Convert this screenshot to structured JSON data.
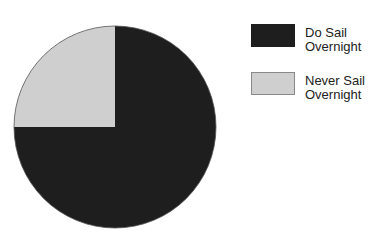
{
  "chart_data": {
    "type": "pie",
    "title": "",
    "categories": [
      "Do Sail Overnight",
      "Never Sail Overnight"
    ],
    "values": [
      75,
      25
    ],
    "unit": "percent",
    "colors": [
      "#1e1e1e",
      "#cfcfcf"
    ],
    "start_angle_deg": 90,
    "direction": "clockwise",
    "legend_position": "right",
    "geometry": {
      "cx": 115,
      "cy": 127,
      "r": 101
    }
  },
  "legend": [
    {
      "line1": "Do Sail",
      "line2": "Overnight",
      "color": "#1e1e1e",
      "border": "#1e1e1e"
    },
    {
      "line1": "Never Sail",
      "line2": "Overnight",
      "color": "#cfcfcf",
      "border": "#8a8a8a"
    }
  ]
}
